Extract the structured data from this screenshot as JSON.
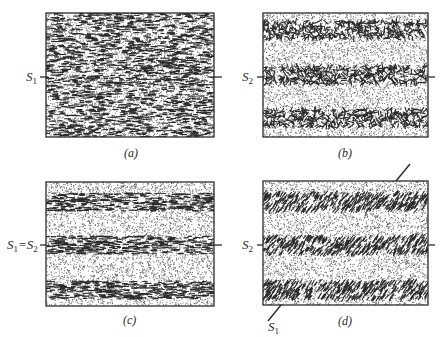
{
  "figure": {
    "panels": [
      {
        "id": "a",
        "caption": "(a)",
        "box": {
          "x": 46,
          "y": 13,
          "w": 168,
          "h": 124
        },
        "pattern": "uniform-horizontal-dashes",
        "left_label": {
          "main": "S",
          "sub": "1",
          "suffix": ""
        },
        "tick_y": 77
      },
      {
        "id": "b",
        "caption": "(b)",
        "box": {
          "x": 263,
          "y": 13,
          "w": 165,
          "h": 124
        },
        "pattern": "bands-random-orientation",
        "bands_y": [
          30,
          75,
          118
        ],
        "left_label": {
          "main": "S",
          "sub": "2",
          "suffix": ""
        },
        "tick_y": 77
      },
      {
        "id": "c",
        "caption": "(c)",
        "box": {
          "x": 46,
          "y": 182,
          "w": 168,
          "h": 124
        },
        "pattern": "bands-horizontal-dashes",
        "bands_y": [
          202,
          245,
          290
        ],
        "left_label": {
          "main": "S",
          "sub": "1",
          "eq": "=",
          "main2": "S",
          "sub2": "2"
        },
        "tick_y": 245
      },
      {
        "id": "d",
        "caption": "(d)",
        "box": {
          "x": 263,
          "y": 181,
          "w": 165,
          "h": 124
        },
        "pattern": "bands-oblique-dashes",
        "bands_y": [
          202,
          245,
          290
        ],
        "left_label": {
          "main": "S",
          "sub": "2",
          "suffix": ""
        },
        "tick_y": 245,
        "oblique_label": {
          "main": "S",
          "sub": "1"
        }
      }
    ],
    "colors": {
      "ink": "#2b2b2b",
      "stipple": "#555555",
      "paper": "#ffffff"
    }
  }
}
